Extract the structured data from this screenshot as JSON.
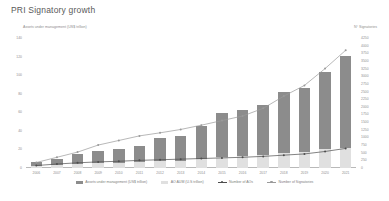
{
  "title": "PRI Signatory growth",
  "axis_titles": {
    "left": "Assets under management (US$ trillion)",
    "right": "N° Signatories"
  },
  "colors": {
    "bar_total": "#8c8c8c",
    "bar_ao": "#e3e3e3",
    "line_signatories": "#9a9a9a",
    "line_aos": "#4d4d4d",
    "axis_text": "#8e8e8e",
    "title_text": "#595959"
  },
  "legend": {
    "items": [
      {
        "label": "Assets under management (US$ trillion)",
        "type": "bar",
        "color": "#8c8c8c"
      },
      {
        "label": "AO AUM (U.S trillion)",
        "type": "bar-light",
        "color": "#e0e0e0"
      },
      {
        "label": "Number of AOs",
        "type": "line",
        "color": "#4d4d4d"
      },
      {
        "label": "Number of Signatories",
        "type": "line",
        "color": "#9a9a9a"
      }
    ]
  },
  "chart_data": {
    "type": "bar",
    "title": "PRI Signatory growth",
    "xlabel": "",
    "ylabel": "Assets under management (US$ trillion)",
    "y2label": "N° Signatories",
    "grid": false,
    "legend_position": "bottom",
    "categories": [
      "2006",
      "2007",
      "2008",
      "2009",
      "2010",
      "2011",
      "2012",
      "2013",
      "2014",
      "2015",
      "2016",
      "2017",
      "2018",
      "2019",
      "2020",
      "2021"
    ],
    "ylim": [
      0,
      140
    ],
    "y_ticks": [
      0,
      20,
      40,
      60,
      80,
      100,
      120,
      140
    ],
    "y2lim": [
      0,
      4250
    ],
    "y2_ticks": [
      0,
      250,
      500,
      750,
      1000,
      1250,
      1500,
      1750,
      2000,
      2250,
      2500,
      2750,
      3000,
      3250,
      3500,
      3750,
      4000,
      4250
    ],
    "series": [
      {
        "name": "Assets under management (US$ trillion)",
        "type": "bar",
        "axis": "left",
        "color": "#8c8c8c",
        "values": [
          6.5,
          10,
          15,
          18,
          21,
          24,
          32,
          34,
          45,
          59,
          62,
          68,
          82,
          86,
          103,
          121
        ]
      },
      {
        "name": "AO AUM (U.S trillion)",
        "type": "bar",
        "axis": "left",
        "color": "#e0e0e0",
        "values": [
          2,
          3,
          4,
          5,
          5.5,
          6,
          7.5,
          8,
          10,
          12,
          13,
          14,
          16,
          17,
          20,
          22
        ]
      },
      {
        "name": "Number of AOs",
        "type": "line",
        "axis": "right",
        "color": "#4d4d4d",
        "values": [
          80,
          130,
          170,
          200,
          220,
          250,
          270,
          290,
          310,
          330,
          350,
          380,
          420,
          460,
          540,
          640
        ]
      },
      {
        "name": "Number of Signatories",
        "type": "line",
        "axis": "right",
        "color": "#9a9a9a",
        "values": [
          180,
          350,
          520,
          750,
          900,
          1050,
          1150,
          1260,
          1400,
          1550,
          1700,
          1950,
          2350,
          2700,
          3250,
          3850
        ]
      }
    ]
  }
}
